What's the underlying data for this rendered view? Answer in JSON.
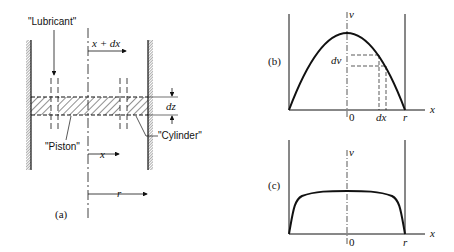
{
  "panel_a": {
    "caption": "(a)",
    "labels": {
      "lubricant": "\"Lubricant\"",
      "piston": "\"Piston\"",
      "cylinder": "\"Cylinder\"",
      "x_plus_dx": "x + dx",
      "x": "x",
      "dz": "dz",
      "r": "r"
    }
  },
  "panel_b": {
    "caption": "(b)",
    "axis": {
      "y_label": "v",
      "x_label": "x",
      "origin": "0",
      "r": "r"
    },
    "annotations": {
      "dv": "dv",
      "dx": "dx"
    }
  },
  "panel_c": {
    "caption": "(c)",
    "axis": {
      "y_label": "v",
      "x_label": "x",
      "origin": "0",
      "r": "r"
    }
  },
  "colors": {
    "ink": "#111111",
    "background": "#ffffff"
  }
}
